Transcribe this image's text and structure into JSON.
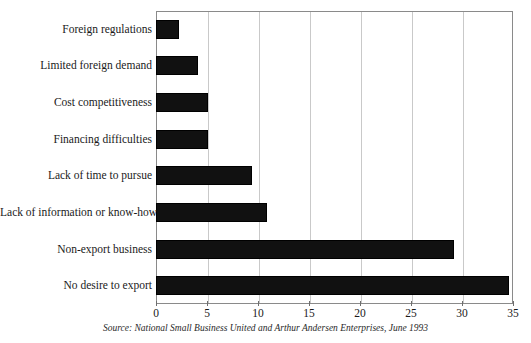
{
  "chart_data": {
    "type": "bar",
    "orientation": "horizontal",
    "title": "",
    "xlabel": "",
    "ylabel": "",
    "xlim": [
      0,
      35
    ],
    "grid": true,
    "legend": false,
    "categories": [
      "Foreign regulations",
      "Limited foreign demand",
      "Cost competitiveness",
      "Financing difficulties",
      "Lack of time to pursue",
      "Lack of information or know-how",
      "Non-export business",
      "No desire to export"
    ],
    "values": [
      2.3,
      4.1,
      5.1,
      5.1,
      9.4,
      10.9,
      29.2,
      34.6
    ],
    "xticks": [
      0,
      5,
      10,
      15,
      20,
      25,
      30,
      35
    ],
    "xtick_labels": [
      "0",
      "5",
      "10",
      "15",
      "20",
      "25",
      "30",
      "35"
    ],
    "bar_color": "#111111",
    "source": "Source: National Small Business United and Arthur Andersen Enterprises, June 1993"
  },
  "figure": {
    "source_note": "Source: National Small Business United and Arthur Andersen Enterprises, June 1993",
    "clipped_title": ""
  }
}
